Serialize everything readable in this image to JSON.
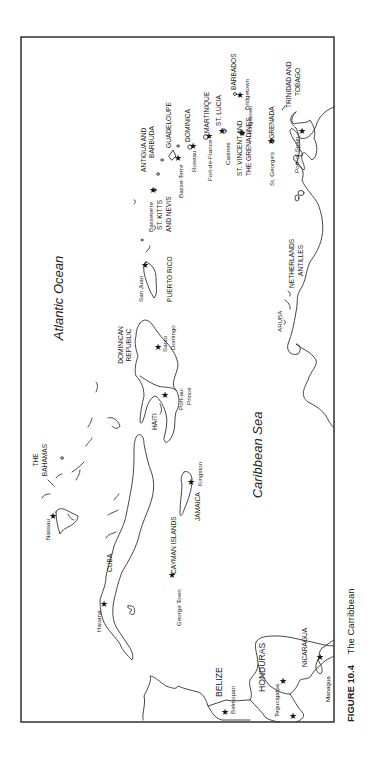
{
  "figure": {
    "caption_label": "FIGURE 10.4",
    "caption_title": "The Carribbean",
    "orientation": "rotated 90° counter-clockwise"
  },
  "water_bodies": [
    {
      "name": "Atlantic Ocean"
    },
    {
      "name": "Caribbean Sea"
    }
  ],
  "countries": [
    {
      "name": "THE BAHAMAS",
      "lines": [
        "THE",
        "BAHAMAS"
      ],
      "capital": "Nassau"
    },
    {
      "name": "CUBA",
      "lines": [
        "CUBA"
      ],
      "capital": "Havana"
    },
    {
      "name": "CAYMAN ISLANDS",
      "lines": [
        "CAYMAN ISLANDS"
      ],
      "capital": "George Town"
    },
    {
      "name": "JAMAICA",
      "lines": [
        "JAMAICA"
      ],
      "capital": "Kingston"
    },
    {
      "name": "HAITI",
      "lines": [
        "HAITI"
      ],
      "capital": "Port-au-Prince",
      "capital_lines": [
        "Port-au-",
        "Prince"
      ]
    },
    {
      "name": "DOMINICAN REPUBLIC",
      "lines": [
        "DOMINICAN",
        "REPUBLIC"
      ],
      "capital": "Santo Domingo",
      "capital_lines": [
        "Santo",
        "Domingo"
      ]
    },
    {
      "name": "PUERTO RICO",
      "lines": [
        "PUERTO RICO"
      ],
      "capital": "San Juan"
    },
    {
      "name": "ST. KITTS AND NEVIS",
      "lines": [
        "ST. KITTS",
        "AND NEVIS"
      ],
      "capital": "Basseterre"
    },
    {
      "name": "ANTIGUA AND BARBUDA",
      "lines": [
        "ANTIGUA AND",
        "BARBUDA"
      ]
    },
    {
      "name": "GUADELOUPE",
      "lines": [
        "GUADELOUPE"
      ],
      "capital": "Basse-Terre"
    },
    {
      "name": "DOMINICA",
      "lines": [
        "DOMINICA"
      ],
      "capital": "Roseau"
    },
    {
      "name": "MARTINIQUE",
      "lines": [
        "MARTINIQUE"
      ],
      "capital": "Fort-de-France"
    },
    {
      "name": "ST. LUCIA",
      "lines": [
        "ST. LUCIA"
      ],
      "capital": "Castries"
    },
    {
      "name": "BARBADOS",
      "lines": [
        "BARBADOS"
      ],
      "capital": "Bridgetown"
    },
    {
      "name": "ST. VINCENT AND THE GRENADINES",
      "lines": [
        "ST. VINCENT AND",
        "THE GRENADINES"
      ],
      "capital": "Kingstown"
    },
    {
      "name": "GRENADA",
      "lines": [
        "GRENADA"
      ],
      "capital": "St. George's"
    },
    {
      "name": "TRINIDAD AND TOBAGO",
      "lines": [
        "TRINIDAD AND",
        "TOBAGO"
      ],
      "capital": "Port-of-Spain"
    },
    {
      "name": "NETHERLANDS ANTILLES",
      "lines": [
        "NETHERLANDS",
        "ANTILLES"
      ]
    },
    {
      "name": "ARUBA",
      "lines": [
        "ARUBA"
      ]
    },
    {
      "name": "BELIZE",
      "lines": [
        "BELIZE"
      ],
      "capital": "Belmopan"
    },
    {
      "name": "HONDURAS",
      "lines": [
        "HONDURAS"
      ],
      "capital": "Tegucigalpa"
    },
    {
      "name": "NICARAGUA",
      "lines": [
        "NICARAGUA"
      ],
      "capital": "Managua"
    }
  ],
  "legend": {
    "capital_marker": "star-icon"
  },
  "colors": {
    "background": "#ffffff",
    "ink": "#222222"
  }
}
